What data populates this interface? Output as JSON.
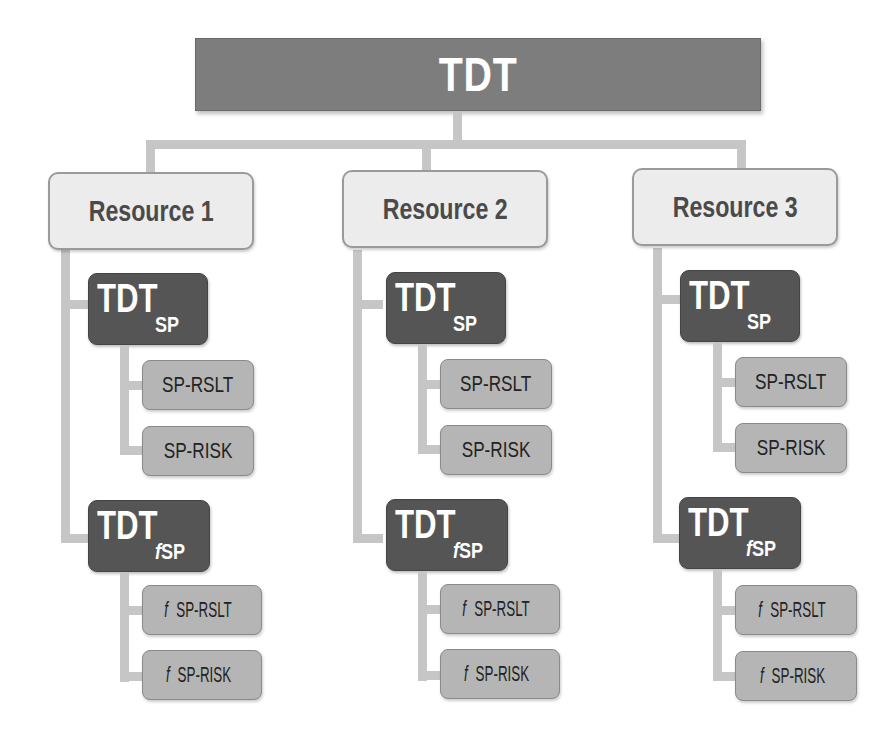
{
  "root": {
    "label": "TDT"
  },
  "colors": {
    "root_fill": "#7d7d7d",
    "resource_fill": "#ececec",
    "tdt_fill": "#555555",
    "leaf_fill": "#b5b5b5",
    "connector": "#c6c6c6"
  },
  "resources": [
    {
      "label": "Resource 1",
      "sp": {
        "main": "TDT",
        "sub": "SP",
        "children": [
          {
            "label": "SP-RSLT"
          },
          {
            "label": "SP-RISK"
          }
        ]
      },
      "fsp": {
        "main": "TDT",
        "sub_f": "f",
        "sub": "SP",
        "children": [
          {
            "f": "f",
            "label": "SP-RSLT"
          },
          {
            "f": "f",
            "label": "SP-RISK"
          }
        ]
      }
    },
    {
      "label": "Resource 2",
      "sp": {
        "main": "TDT",
        "sub": "SP",
        "children": [
          {
            "label": "SP-RSLT"
          },
          {
            "label": "SP-RISK"
          }
        ]
      },
      "fsp": {
        "main": "TDT",
        "sub_f": "f",
        "sub": "SP",
        "children": [
          {
            "f": "f",
            "label": "SP-RSLT"
          },
          {
            "f": "f",
            "label": "SP-RISK"
          }
        ]
      }
    },
    {
      "label": "Resource 3",
      "sp": {
        "main": "TDT",
        "sub": "SP",
        "children": [
          {
            "label": "SP-RSLT"
          },
          {
            "label": "SP-RISK"
          }
        ]
      },
      "fsp": {
        "main": "TDT",
        "sub_f": "f",
        "sub": "SP",
        "children": [
          {
            "f": "f",
            "label": "SP-RSLT"
          },
          {
            "f": "f",
            "label": "SP-RISK"
          }
        ]
      }
    }
  ]
}
